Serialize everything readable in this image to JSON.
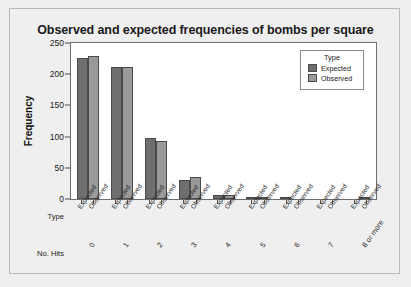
{
  "figure": {
    "title": "Observed and expected frequencies of bombs per square"
  },
  "legend": {
    "title": "Type",
    "entries": [
      {
        "label": "Expected",
        "color": "#6f6f6f"
      },
      {
        "label": "Observed",
        "color": "#9a9a9a"
      }
    ]
  },
  "axes": {
    "ylabel": "Frequency",
    "yticks": [
      "0",
      "50",
      "100",
      "150",
      "200",
      "250"
    ],
    "row_headers": {
      "type": "Type",
      "hits": "No. Hits"
    },
    "type_labels": {
      "expected": "Expected",
      "observed": "Observed"
    }
  },
  "chart_data": {
    "type": "bar",
    "title": "Observed and expected frequencies of bombs per square",
    "xlabel": "No. Hits",
    "ylabel": "Frequency",
    "ylim": [
      0,
      250
    ],
    "ytick_values": [
      0,
      50,
      100,
      150,
      200,
      250
    ],
    "grid": false,
    "legend_position": "top-right",
    "legend_title": "Type",
    "categories": [
      "0",
      "1",
      "2",
      "3",
      "4",
      "5",
      "6",
      "7",
      "8 or more"
    ],
    "series": [
      {
        "name": "Expected",
        "color": "#6f6f6f",
        "values": [
          226.7,
          211.4,
          98.5,
          30.6,
          7.1,
          1.3,
          0.2,
          0.0,
          0.0
        ]
      },
      {
        "name": "Observed",
        "color": "#9a9a9a",
        "values": [
          229,
          211,
          93,
          35,
          7,
          1,
          0,
          0,
          1
        ]
      }
    ]
  }
}
